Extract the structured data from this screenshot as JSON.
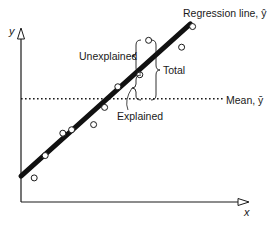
{
  "axes": {
    "x_label": "x",
    "y_label": "y"
  },
  "labels": {
    "regression_line": "Regression line, ŷ",
    "mean_line": "Mean, ȳ",
    "unexplained": "Unexplained",
    "total": "Total",
    "explained": "Explained"
  },
  "colors": {
    "ink": "#1a1a1a",
    "background": "#ffffff"
  },
  "points": [
    {
      "x": 0.06,
      "y": 0.14
    },
    {
      "x": 0.11,
      "y": 0.27
    },
    {
      "x": 0.19,
      "y": 0.4
    },
    {
      "x": 0.23,
      "y": 0.42
    },
    {
      "x": 0.33,
      "y": 0.45
    },
    {
      "x": 0.38,
      "y": 0.55
    },
    {
      "x": 0.44,
      "y": 0.67
    },
    {
      "x": 0.54,
      "y": 0.74
    },
    {
      "x": 0.58,
      "y": 0.94
    },
    {
      "x": 0.73,
      "y": 0.9
    },
    {
      "x": 0.78,
      "y": 1.02
    }
  ],
  "regression": {
    "intercept": 0.15,
    "slope": 1.15,
    "x_end": 0.77
  },
  "mean": 0.6,
  "highlight_point_index": 8
}
